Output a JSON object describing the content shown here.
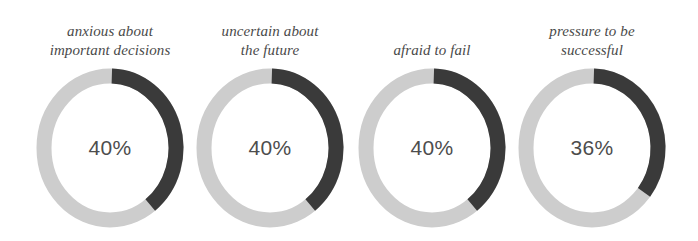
{
  "colors": {
    "background": "#ffffff",
    "track": "#cdcdcd",
    "fill": "#3a3a3a",
    "label_text": "#4a4a4a",
    "value_text": "#4d4d4d"
  },
  "chart_data": {
    "type": "pie",
    "title": "",
    "subtitle": "",
    "xlabel": "",
    "ylabel": "",
    "legend": [],
    "categories": [
      "anxious about important decisions",
      "uncertain about the future",
      "afraid to fail",
      "pressure to be successful"
    ],
    "values": [
      40,
      40,
      40,
      36
    ],
    "value_labels": [
      "40%",
      "40%",
      "40%",
      "36%"
    ],
    "units": "percent",
    "ylim": [
      0,
      100
    ],
    "series": [
      {
        "name": "share",
        "values": [
          40,
          40,
          40,
          36
        ],
        "color": "#3a3a3a"
      },
      {
        "name": "remainder",
        "values": [
          60,
          60,
          60,
          64
        ],
        "color": "#cdcdcd"
      }
    ]
  },
  "donuts": [
    {
      "id": "anxious-about-important-decisions",
      "label_lines": [
        "anxious about",
        "important decisions"
      ],
      "value_label": "40%",
      "percent": 40
    },
    {
      "id": "uncertain-about-the-future",
      "label_lines": [
        "uncertain about",
        "the future"
      ],
      "value_label": "40%",
      "percent": 40
    },
    {
      "id": "afraid-to-fail",
      "label_lines": [
        "afraid to fail"
      ],
      "value_label": "40%",
      "percent": 40
    },
    {
      "id": "pressure-to-be-successful",
      "label_lines": [
        "pressure to be",
        "successful"
      ],
      "value_label": "36%",
      "percent": 36
    }
  ]
}
